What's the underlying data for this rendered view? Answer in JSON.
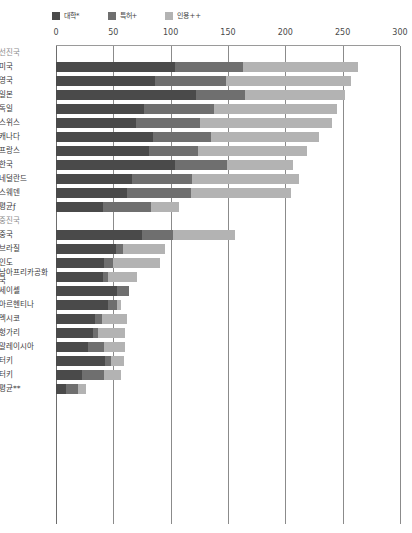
{
  "colors": {
    "university": "#4a4a4a",
    "patent": "#6f6f6f",
    "citation": "#b3b3b3",
    "grid": "#8b8b8b",
    "text": "#3a3a3a",
    "group_text": "#8d8d8d"
  },
  "legend": {
    "items": [
      {
        "label": "대학*",
        "icon": "square-swatch-dark",
        "color_key": "university"
      },
      {
        "label": "특허+",
        "icon": "square-swatch-medium",
        "color_key": "patent"
      },
      {
        "label": "인용++",
        "icon": "square-swatch-light",
        "color_key": "citation"
      }
    ]
  },
  "chart_data": {
    "type": "bar",
    "subtype": "stacked-horizontal",
    "title": "",
    "xlabel": "",
    "ylabel": "",
    "xlim": [
      0,
      300
    ],
    "xticks": [
      0,
      50,
      100,
      150,
      200,
      250,
      300
    ],
    "tick_labels": [
      "0",
      "50",
      "100",
      "150",
      "200",
      "250",
      "300"
    ],
    "grid": true,
    "legend_position": "top-left",
    "series": [
      {
        "name": "대학*",
        "color_key": "university"
      },
      {
        "name": "특허+",
        "color_key": "patent"
      },
      {
        "name": "인용++",
        "color_key": "citation"
      }
    ],
    "groups": [
      {
        "name": "선진국",
        "rows": [
          {
            "label": "미국",
            "values": [
              104,
              59,
              100
            ],
            "total": 263
          },
          {
            "label": "영국",
            "values": [
              86,
              62,
              109
            ],
            "total": 257
          },
          {
            "label": "일본",
            "values": [
              122,
              43,
              87
            ],
            "total": 252
          },
          {
            "label": "독일",
            "values": [
              77,
              61,
              107
            ],
            "total": 245
          },
          {
            "label": "스위스",
            "values": [
              70,
              56,
              115
            ],
            "total": 241
          },
          {
            "label": "캐나다",
            "values": [
              85,
              50,
              94
            ],
            "total": 229
          },
          {
            "label": "프랑스",
            "values": [
              81,
              43,
              95
            ],
            "total": 219
          },
          {
            "label": "한국",
            "values": [
              104,
              45,
              58
            ],
            "total": 207
          },
          {
            "label": "네덜란드",
            "values": [
              66,
              53,
              93
            ],
            "total": 212
          },
          {
            "label": "스웨덴",
            "values": [
              62,
              56,
              87
            ],
            "total": 205
          },
          {
            "label": "평균ƒ",
            "values": [
              41,
              42,
              24
            ],
            "total": 107
          }
        ]
      },
      {
        "name": "중진국",
        "rows": [
          {
            "label": "중국",
            "values": [
              75,
              27,
              54
            ],
            "total": 156
          },
          {
            "label": "브라질",
            "values": [
              52,
              6,
              37
            ],
            "total": 95
          },
          {
            "label": "인도",
            "values": [
              42,
              8,
              41
            ],
            "total": 91
          },
          {
            "label": "남아프리카공화국",
            "values": [
              41,
              4,
              26
            ],
            "total": 71
          },
          {
            "label": "세이셸",
            "values": [
              53,
              11,
              0
            ],
            "total": 64
          },
          {
            "label": "아르헨티나",
            "values": [
              45,
              8,
              4
            ],
            "total": 57
          },
          {
            "label": "멕시코",
            "values": [
              34,
              6,
              22
            ],
            "total": 62
          },
          {
            "label": "헝가리",
            "values": [
              32,
              5,
              23
            ],
            "total": 60
          },
          {
            "label": "말레이시아",
            "values": [
              28,
              14,
              18
            ],
            "total": 60
          },
          {
            "label": "터키",
            "values": [
              43,
              5,
              11
            ],
            "total": 59
          },
          {
            "label": "터키2",
            "values": [
              23,
              19,
              15
            ],
            "total": 57
          },
          {
            "label": "평균**",
            "values": [
              9,
              10,
              7
            ],
            "total": 26
          }
        ]
      }
    ]
  }
}
